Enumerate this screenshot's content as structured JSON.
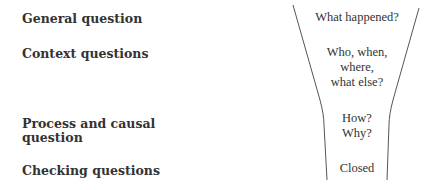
{
  "rows": [
    {
      "label": "General question",
      "funnel": "What happened?"
    },
    {
      "label": "Context questions",
      "funnel_lines": [
        "Who, when,",
        "where,",
        "what else?"
      ]
    },
    {
      "label_lines": [
        "Process and causal",
        "question"
      ],
      "funnel_lines": [
        "How?",
        "Why?"
      ]
    },
    {
      "label": "Checking questions",
      "funnel": "Closed"
    }
  ]
}
